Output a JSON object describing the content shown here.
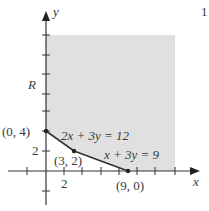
{
  "figure": {
    "page_mark": "1",
    "axis_labels": {
      "x": "x",
      "y": "y"
    },
    "region_label": "R",
    "tick_labels": {
      "x_2": "2",
      "y_2": "2"
    },
    "points": [
      {
        "label": "(0, 4)",
        "x": 0,
        "y": 4
      },
      {
        "label": "(3, 2)",
        "x": 3,
        "y": 2
      },
      {
        "label": "(9, 0)",
        "x": 9,
        "y": 0
      }
    ],
    "lines": [
      {
        "equation": "2x + 3y = 12"
      },
      {
        "equation": "x + 3y = 9"
      }
    ],
    "colors": {
      "shade": "#e0e0e0",
      "axis": "#333333",
      "boundary": "#333333"
    }
  }
}
